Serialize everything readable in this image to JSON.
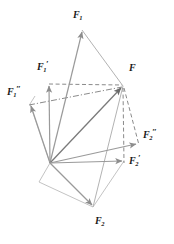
{
  "figure": {
    "type": "vector-diagram",
    "background_color": "#ffffff",
    "stroke_color": "#9a9a9a",
    "dark_stroke_color": "#6f6f6f",
    "label_color": "#1a1a1a",
    "origin": {
      "x": 50,
      "y": 163,
      "name": "common-origin-point"
    },
    "resultant_point": {
      "x": 123,
      "y": 86,
      "name": "resultant-head-point"
    }
  },
  "labels": {
    "f1": {
      "base": "F",
      "sub": "1",
      "prime": "",
      "x": 73,
      "y": 12
    },
    "f1_prime": {
      "base": "F",
      "sub": "1",
      "prime": "′",
      "x": 38,
      "y": 64
    },
    "f1_double_prime": {
      "base": "F",
      "sub": "1",
      "prime": "″",
      "x": 8,
      "y": 89
    },
    "f": {
      "base": "F",
      "sub": "",
      "prime": "",
      "x": 129,
      "y": 65
    },
    "f2_double_prime": {
      "base": "F",
      "sub": "2",
      "prime": "″",
      "x": 143,
      "y": 132
    },
    "f2_prime": {
      "base": "F",
      "sub": "2",
      "prime": "′",
      "x": 129,
      "y": 158
    },
    "f2": {
      "base": "F",
      "sub": "2",
      "prime": "",
      "x": 95,
      "y": 218
    }
  },
  "vectors": [
    {
      "name": "vector-f1",
      "from": [
        50,
        163
      ],
      "to": [
        82,
        30
      ],
      "style": "solid-arrow",
      "label": "F1"
    },
    {
      "name": "vector-f1-prime",
      "from": [
        50,
        163
      ],
      "to": [
        49,
        84
      ],
      "style": "solid-arrow",
      "label": "F1'"
    },
    {
      "name": "vector-f1-double-prime",
      "from": [
        50,
        163
      ],
      "to": [
        30,
        104
      ],
      "style": "solid-arrow",
      "label": "F1''"
    },
    {
      "name": "vector-resultant-f",
      "from": [
        50,
        163
      ],
      "to": [
        123,
        86
      ],
      "style": "solid-arrow",
      "label": "F"
    },
    {
      "name": "vector-f2",
      "from": [
        50,
        163
      ],
      "to": [
        93,
        207
      ],
      "style": "solid-arrow",
      "label": "F2"
    },
    {
      "name": "vector-f2-prime",
      "from": [
        50,
        163
      ],
      "to": [
        124,
        161
      ],
      "style": "solid-arrow",
      "label": "F2'"
    },
    {
      "name": "vector-f2-double-prime",
      "from": [
        50,
        163
      ],
      "to": [
        138,
        143
      ],
      "style": "solid-arrow",
      "label": "F2''"
    }
  ],
  "construction_lines": [
    {
      "name": "parallelogram-side-f1-to-f",
      "from": [
        82,
        30
      ],
      "to": [
        123,
        86
      ],
      "style": "solid"
    },
    {
      "name": "parallelogram-side-f2-to-f",
      "from": [
        93,
        207
      ],
      "to": [
        123,
        86
      ],
      "style": "solid"
    },
    {
      "name": "dashed-horizontal-f1prime",
      "from": [
        49,
        84
      ],
      "to": [
        123,
        86
      ],
      "style": "dashed"
    },
    {
      "name": "dashdot-f1doubleprime",
      "from": [
        30,
        104
      ],
      "to": [
        123,
        86
      ],
      "style": "dashdot"
    },
    {
      "name": "dashed-vertical-f2prime",
      "from": [
        123,
        86
      ],
      "to": [
        124,
        161
      ],
      "style": "dashed"
    },
    {
      "name": "dashed-diagonal-f2dblprime",
      "from": [
        123,
        86
      ],
      "to": [
        138,
        143
      ],
      "style": "dashed"
    }
  ]
}
